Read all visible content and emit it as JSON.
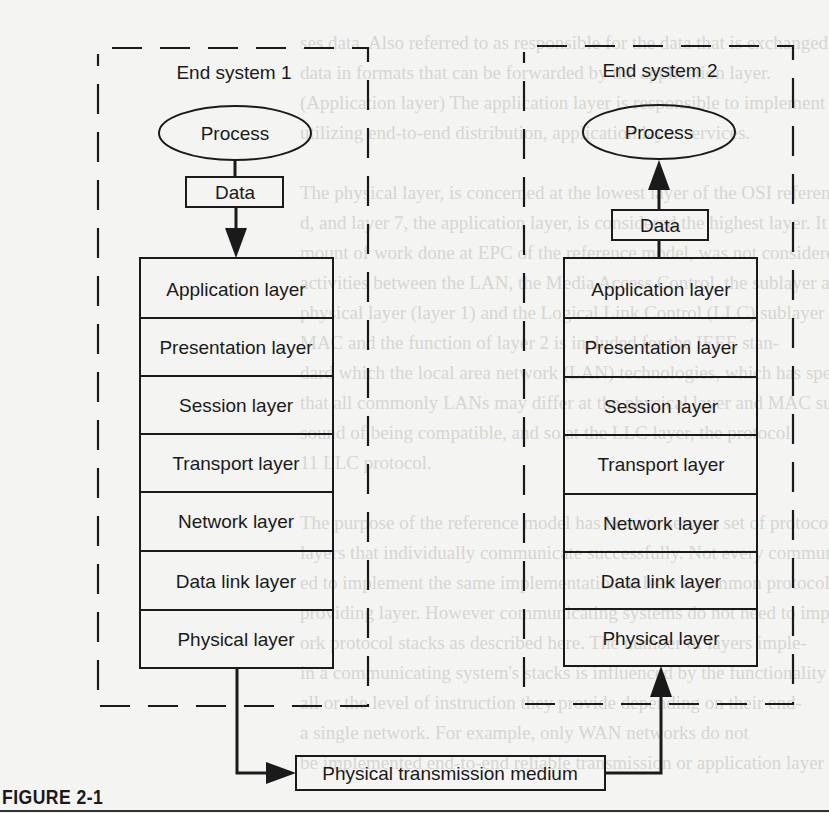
{
  "figure": {
    "caption": "FIGURE 2-1",
    "end_system_1": {
      "title": "End system 1",
      "process_label": "Process",
      "data_label": "Data",
      "data_flow": "down",
      "layers": [
        "Application layer",
        "Presentation layer",
        "Session layer",
        "Transport layer",
        "Network layer",
        "Data link layer",
        "Physical layer"
      ]
    },
    "end_system_2": {
      "title": "End system 2",
      "process_label": "Process",
      "data_label": "Data",
      "data_flow": "up",
      "layers": [
        "Application layer",
        "Presentation layer",
        "Session layer",
        "Transport layer",
        "Network layer",
        "Data link layer",
        "Physical layer"
      ]
    },
    "medium_label": "Physical transmission medium"
  },
  "background_bleed": {
    "lines": [
      "ses data. Also referred to as responsible for the data that is exchanged",
      "data in formats that can be forwarded by the application layer.",
      "(Application layer) The application layer is responsible to implement or",
      "utilizing end-to-end distribution, application layer services.",
      "",
      "The physical layer, is concerned at the lowest layer of the OSI reference",
      "d, and layer 7, the application layer, is considered the highest layer. It is",
      "mount of work done at EPC of the reference model, was not considered",
      "activities between the LAN, the Media Access Control, the sublayer above",
      "physical layer (layer 1) and the Logical Link Control (LLC) sublayer above",
      "MAC and the function of layer 2 is included for the IEEE stan-",
      "dard which the local area network (LAN) technologies, which has speci-",
      "that all commonly LANs may differ at the physical layer and MAC sublayer,",
      "sound of being compatible, and so at the LLC layer, the protocol",
      "11 LLC protocol.",
      "",
      "The purpose of the reference model has been to serve a set of protocols",
      "layers that individually communicate successfully. Not every communica-",
      "ed to implement the same implementation at least a common protocol per",
      "providing layer. However communicating systems do not need to implement",
      "ork protocol stacks as described here. The number of layers imple-",
      "in a communicating system's stacks is influenced by the functionality of",
      "all or the level of instruction they provide depending on their end-",
      "a single network. For example, only WAN networks do not",
      "be implemented end-to-end reliable transmission or application layer protocols"
    ]
  }
}
